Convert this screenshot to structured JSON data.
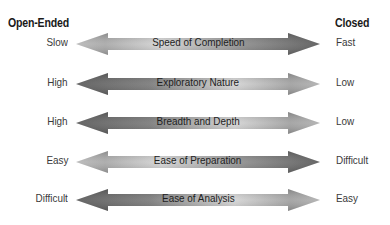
{
  "headers": {
    "left": "Open-Ended",
    "right": "Closed"
  },
  "colors": {
    "light": "#d4d4d4",
    "mid": "#a8a8a8",
    "dark": "#5a5a5a",
    "text": "#2a2a2a"
  },
  "rows": [
    {
      "left": "Slow",
      "label": "Speed of Completion",
      "right": "Fast",
      "gradient": "light-to-dark"
    },
    {
      "left": "High",
      "label": "Exploratory Nature",
      "right": "Low",
      "gradient": "dark-to-light"
    },
    {
      "left": "High",
      "label": "Breadth and Depth",
      "right": "Low",
      "gradient": "dark-to-light"
    },
    {
      "left": "Easy",
      "label": "Ease of Preparation",
      "right": "Difficult",
      "gradient": "light-to-dark"
    },
    {
      "left": "Difficult",
      "label": "Ease of Analysis",
      "right": "Easy",
      "gradient": "dark-to-light"
    }
  ]
}
